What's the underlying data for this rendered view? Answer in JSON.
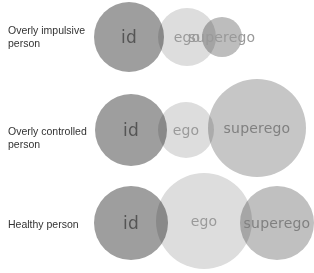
{
  "colors": {
    "id": "#9e9e9e",
    "ego": "#dddddd",
    "superego": "#bdbdbd",
    "text_dark": "#555555",
    "text_light": "#999999"
  },
  "rows": [
    {
      "label": "Overly impulsive person",
      "label_lines": [
        "Overly impulsive",
        "person"
      ],
      "circles": [
        {
          "name": "id",
          "text": "id",
          "cx": 129,
          "cy": 37,
          "r": 35,
          "color": "#9e9e9e",
          "text_color": "#555555",
          "font": 17
        },
        {
          "name": "ego",
          "text": "ego",
          "cx": 187,
          "cy": 37,
          "r": 29,
          "color": "#dddddd",
          "text_color": "#9a9a9a",
          "font": 14
        },
        {
          "name": "superego",
          "text": "superego",
          "cx": 222,
          "cy": 37,
          "r": 20,
          "color": "#bdbdbd",
          "text_color": "#999999",
          "font": 14
        }
      ]
    },
    {
      "label": "Overly controlled person",
      "label_lines": [
        "Overly controlled",
        "person"
      ],
      "circles": [
        {
          "name": "id",
          "text": "id",
          "cx": 131,
          "cy": 130,
          "r": 36,
          "color": "#9e9e9e",
          "text_color": "#555555",
          "font": 17
        },
        {
          "name": "ego",
          "text": "ego",
          "cx": 186,
          "cy": 130,
          "r": 28,
          "color": "#dddddd",
          "text_color": "#9a9a9a",
          "font": 14
        },
        {
          "name": "superego",
          "text": "superego",
          "cx": 257,
          "cy": 128,
          "r": 49,
          "color": "#c6c6c6",
          "text_color": "#808080",
          "font": 14
        }
      ]
    },
    {
      "label": "Healthy person",
      "label_lines": [
        "Healthy person"
      ],
      "circles": [
        {
          "name": "id",
          "text": "id",
          "cx": 131,
          "cy": 223,
          "r": 37,
          "color": "#9e9e9e",
          "text_color": "#555555",
          "font": 17
        },
        {
          "name": "ego",
          "text": "ego",
          "cx": 204,
          "cy": 221,
          "r": 48,
          "color": "#dddddd",
          "text_color": "#9a9a9a",
          "font": 14
        },
        {
          "name": "superego",
          "text": "superego",
          "cx": 277,
          "cy": 223,
          "r": 37,
          "color": "#c0c0c0",
          "text_color": "#808080",
          "font": 14
        }
      ]
    }
  ]
}
